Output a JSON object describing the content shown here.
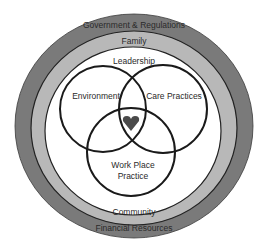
{
  "diagram": {
    "outer_rings": {
      "outermost": {
        "top_label": "Government & Regulations",
        "bottom_label": "Financial Resources",
        "color": "#7a7a7a"
      },
      "middle": {
        "top_label": "Family",
        "bottom_label": "Community",
        "color": "#b4b4b4"
      },
      "inner": {
        "top_label": "Leadership",
        "color": "#ffffff"
      }
    },
    "venn": {
      "circles": [
        {
          "label": "Environment"
        },
        {
          "label": "Care Practices"
        },
        {
          "label_line1": "Work Place",
          "label_line2": "Practice"
        }
      ],
      "center_icon": "heart-icon",
      "center_color": "#4a4a4a"
    }
  }
}
